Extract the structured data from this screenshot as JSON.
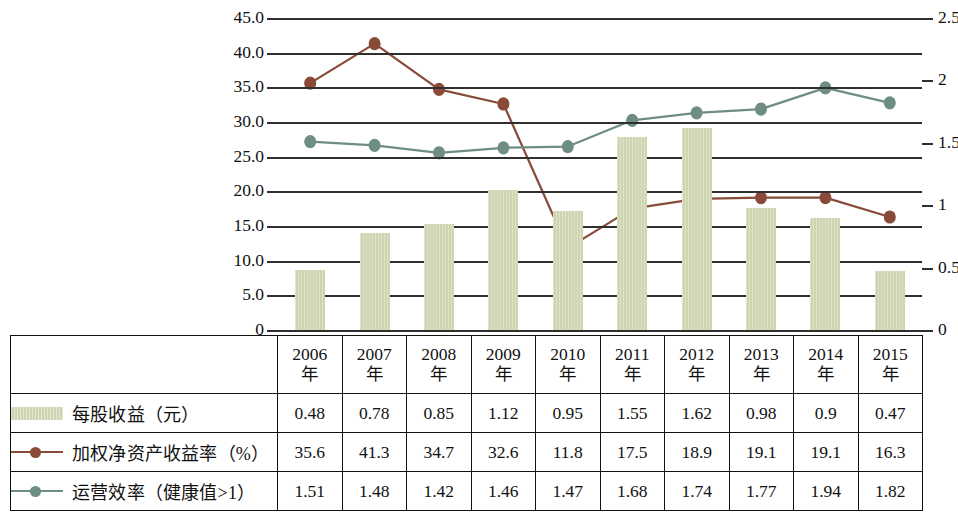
{
  "chart_data": {
    "type": "bar",
    "title": "",
    "xlabel": "",
    "ylabel": "",
    "grid": true,
    "legend_position": "table-left-column",
    "categories": [
      "2006年",
      "2007年",
      "2008年",
      "2009年",
      "2010年",
      "2011年",
      "2012年",
      "2013年",
      "2014年",
      "2015年"
    ],
    "axes": {
      "left": {
        "label": "",
        "ylim": [
          0,
          45
        ],
        "ticks": [
          "0",
          "5.0",
          "10.0",
          "15.0",
          "20.0",
          "25.0",
          "30.0",
          "35.0",
          "40.0",
          "45.0"
        ],
        "tick_values": [
          0,
          5,
          10,
          15,
          20,
          25,
          30,
          35,
          40,
          45
        ],
        "series_bound": "加权净资产收益率（%）"
      },
      "right": {
        "label": "",
        "ylim": [
          0,
          2.5
        ],
        "ticks": [
          "0",
          "0.5",
          "1",
          "1.5",
          "2",
          "2.5"
        ],
        "tick_values": [
          0,
          0.5,
          1,
          1.5,
          2,
          2.5
        ],
        "series_bound": "每股收益（元）, 运营效率（健康值>1）"
      }
    },
    "series": [
      {
        "name": "每股收益（元）",
        "type": "bar",
        "axis": "right",
        "color": "#ccd5af",
        "values": [
          0.48,
          0.78,
          0.85,
          1.12,
          0.95,
          1.55,
          1.62,
          0.98,
          0.9,
          0.47
        ],
        "labels": [
          "0.48",
          "0.78",
          "0.85",
          "1.12",
          "0.95",
          "1.55",
          "1.62",
          "0.98",
          "0.9",
          "0.47"
        ]
      },
      {
        "name": "加权净资产收益率（%）",
        "type": "line",
        "axis": "left",
        "color": "#8a4a38",
        "values": [
          35.6,
          41.3,
          34.7,
          32.6,
          11.8,
          17.5,
          18.9,
          19.1,
          19.1,
          16.3
        ],
        "labels": [
          "35.6",
          "41.3",
          "34.7",
          "32.6",
          "11.8",
          "17.5",
          "18.9",
          "19.1",
          "19.1",
          "16.3"
        ]
      },
      {
        "name": "运营效率（健康值>1）",
        "type": "line",
        "axis": "right",
        "color": "#6d8d85",
        "values": [
          1.51,
          1.48,
          1.42,
          1.46,
          1.47,
          1.68,
          1.74,
          1.77,
          1.94,
          1.82
        ],
        "labels": [
          "1.51",
          "1.48",
          "1.42",
          "1.46",
          "1.47",
          "1.68",
          "1.74",
          "1.77",
          "1.94",
          "1.82"
        ]
      }
    ]
  },
  "table": {
    "year_row": [
      "2006\n年",
      "2007\n年",
      "2008\n年",
      "2009\n年",
      "2010\n年",
      "2011\n年",
      "2012\n年",
      "2013\n年",
      "2014\n年",
      "2015\n年"
    ],
    "rows": [
      {
        "legend_label": "每股收益（元）",
        "swatch": "bar-swatch",
        "color": "#ccd5af",
        "values": [
          "0.48",
          "0.78",
          "0.85",
          "1.12",
          "0.95",
          "1.55",
          "1.62",
          "0.98",
          "0.9",
          "0.47"
        ]
      },
      {
        "legend_label": "加权净资产收益率（%）",
        "swatch": "line-marker-swatch",
        "color": "#8a4a38",
        "values": [
          "35.6",
          "41.3",
          "34.7",
          "32.6",
          "11.8",
          "17.5",
          "18.9",
          "19.1",
          "19.1",
          "16.3"
        ]
      },
      {
        "legend_label": "运营效率（健康值>1）",
        "swatch": "line-marker-swatch",
        "color": "#6d8d85",
        "values": [
          "1.51",
          "1.48",
          "1.42",
          "1.46",
          "1.47",
          "1.68",
          "1.74",
          "1.77",
          "1.94",
          "1.82"
        ]
      }
    ]
  },
  "colors": {
    "bar_fill": "#ccd5af",
    "line_roe": "#8a4a38",
    "line_efficiency": "#6d8d85",
    "axis": "#2f2f2f",
    "text": "#111111",
    "background": "#ffffff"
  }
}
